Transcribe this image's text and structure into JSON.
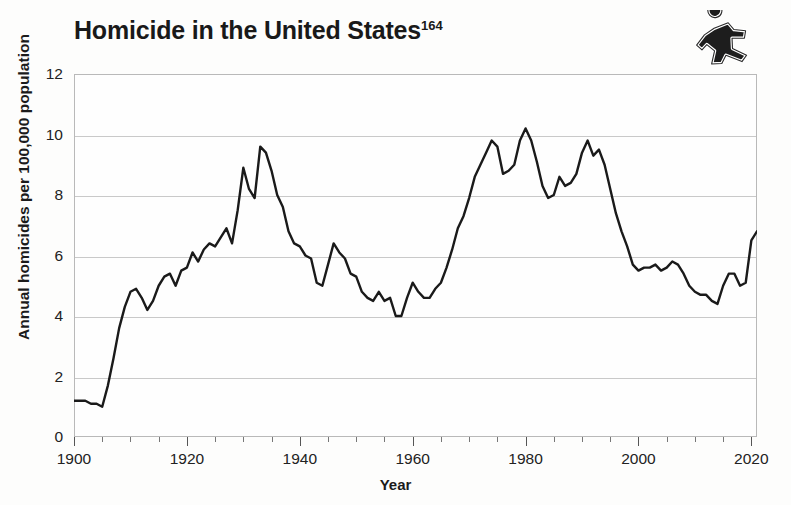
{
  "page": {
    "width": 791,
    "height": 505,
    "background": "#fdfdfc"
  },
  "header": {
    "title_text": "Homicide in the United States",
    "title_superscript": "164",
    "icon_name": "running-figure-icon"
  },
  "chart_data": {
    "type": "line",
    "title": "Homicide in the United States",
    "title_footnote": "164",
    "xlabel": "Year",
    "ylabel": "Annual homicides per 100,000 population",
    "xlim": [
      1900,
      2021
    ],
    "ylim": [
      0,
      12
    ],
    "grid": true,
    "legend": null,
    "line_color": "#1a1a1a",
    "line_width": 2.4,
    "xticks_major": [
      1900,
      1920,
      1940,
      1960,
      1980,
      2000,
      2020
    ],
    "xtick_labels": [
      "1900",
      "1920",
      "1940",
      "1960",
      "1980",
      "2000",
      "2020"
    ],
    "xtick_minor_step": 5,
    "yticks": [
      0,
      2,
      4,
      6,
      8,
      10,
      12
    ],
    "ytick_labels": [
      "0",
      "2",
      "4",
      "6",
      "8",
      "10",
      "12"
    ],
    "x": [
      1900,
      1901,
      1902,
      1903,
      1904,
      1905,
      1906,
      1907,
      1908,
      1909,
      1910,
      1911,
      1912,
      1913,
      1914,
      1915,
      1916,
      1917,
      1918,
      1919,
      1920,
      1921,
      1922,
      1923,
      1924,
      1925,
      1926,
      1927,
      1928,
      1929,
      1930,
      1931,
      1932,
      1933,
      1934,
      1935,
      1936,
      1937,
      1938,
      1939,
      1940,
      1941,
      1942,
      1943,
      1944,
      1945,
      1946,
      1947,
      1948,
      1949,
      1950,
      1951,
      1952,
      1953,
      1954,
      1955,
      1956,
      1957,
      1958,
      1959,
      1960,
      1961,
      1962,
      1963,
      1964,
      1965,
      1966,
      1967,
      1968,
      1969,
      1970,
      1971,
      1972,
      1973,
      1974,
      1975,
      1976,
      1977,
      1978,
      1979,
      1980,
      1981,
      1982,
      1983,
      1984,
      1985,
      1986,
      1987,
      1988,
      1989,
      1990,
      1991,
      1992,
      1993,
      1994,
      1995,
      1996,
      1997,
      1998,
      1999,
      2000,
      2001,
      2002,
      2003,
      2004,
      2005,
      2006,
      2007,
      2008,
      2009,
      2010,
      2011,
      2012,
      2013,
      2014,
      2015,
      2016,
      2017,
      2018,
      2019,
      2020,
      2021
    ],
    "y": [
      1.2,
      1.2,
      1.2,
      1.1,
      1.1,
      1.0,
      1.7,
      2.6,
      3.6,
      4.3,
      4.8,
      4.9,
      4.6,
      4.2,
      4.5,
      5.0,
      5.3,
      5.4,
      5.0,
      5.5,
      5.6,
      6.1,
      5.8,
      6.2,
      6.4,
      6.3,
      6.6,
      6.9,
      6.4,
      7.5,
      8.9,
      8.2,
      7.9,
      9.6,
      9.4,
      8.8,
      8.0,
      7.6,
      6.8,
      6.4,
      6.3,
      6.0,
      5.9,
      5.1,
      5.0,
      5.7,
      6.4,
      6.1,
      5.9,
      5.4,
      5.3,
      4.8,
      4.6,
      4.5,
      4.8,
      4.5,
      4.6,
      4.0,
      4.0,
      4.6,
      5.1,
      4.8,
      4.6,
      4.6,
      4.9,
      5.1,
      5.6,
      6.2,
      6.9,
      7.3,
      7.9,
      8.6,
      9.0,
      9.4,
      9.8,
      9.6,
      8.7,
      8.8,
      9.0,
      9.8,
      10.2,
      9.8,
      9.1,
      8.3,
      7.9,
      8.0,
      8.6,
      8.3,
      8.4,
      8.7,
      9.4,
      9.8,
      9.3,
      9.5,
      9.0,
      8.2,
      7.4,
      6.8,
      6.3,
      5.7,
      5.5,
      5.6,
      5.6,
      5.7,
      5.5,
      5.6,
      5.8,
      5.7,
      5.4,
      5.0,
      4.8,
      4.7,
      4.7,
      4.5,
      4.4,
      5.0,
      5.4,
      5.4,
      5.0,
      5.1,
      6.5,
      6.8
    ]
  }
}
